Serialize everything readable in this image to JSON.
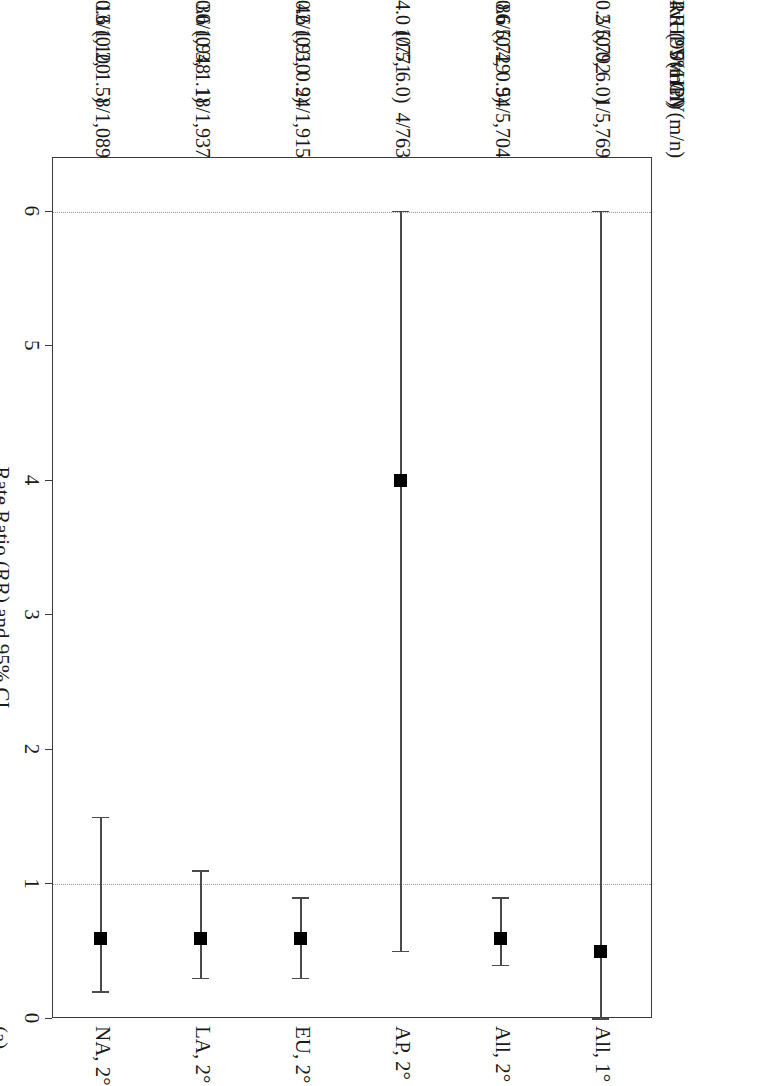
{
  "figure": {
    "panel_label": "(a)",
    "axis_title": "Rate Ratio (RR) and 95% CI",
    "columns": [
      {
        "key": "n9",
        "header": "9vHPV(m/n)"
      },
      {
        "key": "n4",
        "header": "4vHPV(m/n)"
      },
      {
        "key": "rr",
        "header": "RR (95% CI)"
      }
    ]
  },
  "chart_data": {
    "type": "forest",
    "title": "",
    "xlabel": "Rate Ratio (RR) and 95% CI",
    "ylabel": "",
    "xlim": [
      0,
      6.4
    ],
    "xticks": [
      0,
      1,
      2,
      3,
      4,
      5,
      6
    ],
    "xticklabels": [
      "0",
      "1",
      "2",
      "3",
      "4",
      "5",
      "6"
    ],
    "reference_lines": [
      1,
      6
    ],
    "grid": false,
    "legend": null,
    "marker_color": "#000000",
    "line_color": "#4a4a4a",
    "categories": [
      "All, 1°",
      "All, 2°",
      "AP, 2°",
      "EU, 2°",
      "LA, 2°",
      "NA, 2°"
    ],
    "rows": [
      {
        "label": "All, 1°",
        "n9": "1/5,769",
        "n4": "2/5,792",
        "rr": "0.5 (0.0, 6.0)",
        "estimate": 0.5,
        "ci_low": 0.0,
        "ci_high": 6.0
      },
      {
        "label": "All, 2°",
        "n9": "54/5,704",
        "n4": "86/5,729",
        "rr": "0.6 (0.4, 0.9)",
        "estimate": 0.6,
        "ci_low": 0.4,
        "ci_high": 0.9
      },
      {
        "label": "AP, 2°",
        "n9": "4/763",
        "n4": "1/771",
        "rr": "4.0 (0.5, 6.0)",
        "estimate": 4.0,
        "ci_low": 0.5,
        "ci_high": 6.0
      },
      {
        "label": "EU, 2°",
        "n9": "24/1,915",
        "n4": "42/1,910",
        "rr": "0.6 (0.3, 0.9)",
        "estimate": 0.6,
        "ci_low": 0.3,
        "ci_high": 0.9
      },
      {
        "label": "LA, 2°",
        "n9": "18/1,937",
        "n4": "30/1,948",
        "rr": "0.6 (0.3, 1.1)",
        "estimate": 0.6,
        "ci_low": 0.3,
        "ci_high": 1.1
      },
      {
        "label": "NA, 2°",
        "n9": "8/1,089",
        "n4": "13/1,100",
        "rr": "0.6 (0.2, 1.5)",
        "estimate": 0.6,
        "ci_low": 0.2,
        "ci_high": 1.5
      }
    ]
  }
}
